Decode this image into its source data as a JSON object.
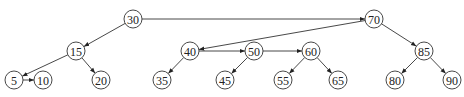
{
  "diagram": {
    "type": "tree-with-sibling-links",
    "nodes": [
      {
        "id": "n30",
        "label": "30",
        "x": 133,
        "y": 19
      },
      {
        "id": "n70",
        "label": "70",
        "x": 374,
        "y": 19
      },
      {
        "id": "n15",
        "label": "15",
        "x": 76,
        "y": 51
      },
      {
        "id": "n40",
        "label": "40",
        "x": 190,
        "y": 51
      },
      {
        "id": "n50",
        "label": "50",
        "x": 254,
        "y": 51
      },
      {
        "id": "n60",
        "label": "60",
        "x": 311,
        "y": 51
      },
      {
        "id": "n85",
        "label": "85",
        "x": 424,
        "y": 51
      },
      {
        "id": "n5",
        "label": "5",
        "x": 14,
        "y": 80
      },
      {
        "id": "n10",
        "label": "10",
        "x": 43,
        "y": 80
      },
      {
        "id": "n20",
        "label": "20",
        "x": 101,
        "y": 80
      },
      {
        "id": "n35",
        "label": "35",
        "x": 162,
        "y": 80
      },
      {
        "id": "n45",
        "label": "45",
        "x": 225,
        "y": 80
      },
      {
        "id": "n55",
        "label": "55",
        "x": 283,
        "y": 80
      },
      {
        "id": "n65",
        "label": "65",
        "x": 338,
        "y": 80
      },
      {
        "id": "n80",
        "label": "80",
        "x": 395,
        "y": 80
      },
      {
        "id": "n90",
        "label": "90",
        "x": 452,
        "y": 80
      }
    ],
    "edges": [
      {
        "from": "n30",
        "to": "n70"
      },
      {
        "from": "n30",
        "to": "n15"
      },
      {
        "from": "n70",
        "to": "n40"
      },
      {
        "from": "n70",
        "to": "n85"
      },
      {
        "from": "n15",
        "to": "n5"
      },
      {
        "from": "n15",
        "to": "n20"
      },
      {
        "from": "n5",
        "to": "n10"
      },
      {
        "from": "n40",
        "to": "n35"
      },
      {
        "from": "n40",
        "to": "n50"
      },
      {
        "from": "n50",
        "to": "n45"
      },
      {
        "from": "n50",
        "to": "n60"
      },
      {
        "from": "n60",
        "to": "n55"
      },
      {
        "from": "n60",
        "to": "n65"
      },
      {
        "from": "n85",
        "to": "n80"
      },
      {
        "from": "n85",
        "to": "n90"
      }
    ],
    "node_radius": 9
  }
}
